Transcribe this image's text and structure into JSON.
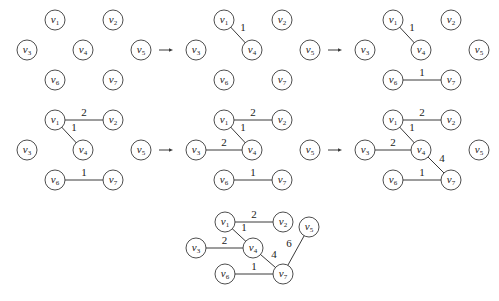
{
  "diagram": {
    "nodes": [
      "v1",
      "v2",
      "v3",
      "v4",
      "v5",
      "v6",
      "v7"
    ],
    "node_labels": {
      "v1": {
        "base": "v",
        "sub": "1"
      },
      "v2": {
        "base": "v",
        "sub": "2"
      },
      "v3": {
        "base": "v",
        "sub": "3"
      },
      "v4": {
        "base": "v",
        "sub": "4"
      },
      "v5": {
        "base": "v",
        "sub": "5"
      },
      "v6": {
        "base": "v",
        "sub": "6"
      },
      "v7": {
        "base": "v",
        "sub": "7"
      }
    },
    "arrow_symbol": "→",
    "steps": [
      {
        "step": 1,
        "edges": []
      },
      {
        "step": 2,
        "edges": [
          {
            "from": "v1",
            "to": "v4",
            "weight": "1"
          }
        ]
      },
      {
        "step": 3,
        "edges": [
          {
            "from": "v1",
            "to": "v4",
            "weight": "1"
          },
          {
            "from": "v6",
            "to": "v7",
            "weight": "1"
          }
        ]
      },
      {
        "step": 4,
        "edges": [
          {
            "from": "v1",
            "to": "v2",
            "weight": "2"
          },
          {
            "from": "v1",
            "to": "v4",
            "weight": "1"
          },
          {
            "from": "v6",
            "to": "v7",
            "weight": "1"
          }
        ]
      },
      {
        "step": 5,
        "edges": [
          {
            "from": "v1",
            "to": "v2",
            "weight": "2"
          },
          {
            "from": "v1",
            "to": "v4",
            "weight": "1"
          },
          {
            "from": "v3",
            "to": "v4",
            "weight": "2"
          },
          {
            "from": "v6",
            "to": "v7",
            "weight": "1"
          }
        ]
      },
      {
        "step": 6,
        "edges": [
          {
            "from": "v1",
            "to": "v2",
            "weight": "2"
          },
          {
            "from": "v1",
            "to": "v4",
            "weight": "1"
          },
          {
            "from": "v3",
            "to": "v4",
            "weight": "2"
          },
          {
            "from": "v4",
            "to": "v7",
            "weight": "4"
          },
          {
            "from": "v6",
            "to": "v7",
            "weight": "1"
          }
        ]
      },
      {
        "step": 7,
        "edges": [
          {
            "from": "v1",
            "to": "v2",
            "weight": "2"
          },
          {
            "from": "v1",
            "to": "v4",
            "weight": "1"
          },
          {
            "from": "v3",
            "to": "v4",
            "weight": "2"
          },
          {
            "from": "v4",
            "to": "v7",
            "weight": "4"
          },
          {
            "from": "v6",
            "to": "v7",
            "weight": "1"
          },
          {
            "from": "v5",
            "to": "v7",
            "weight": "6"
          }
        ]
      }
    ]
  }
}
